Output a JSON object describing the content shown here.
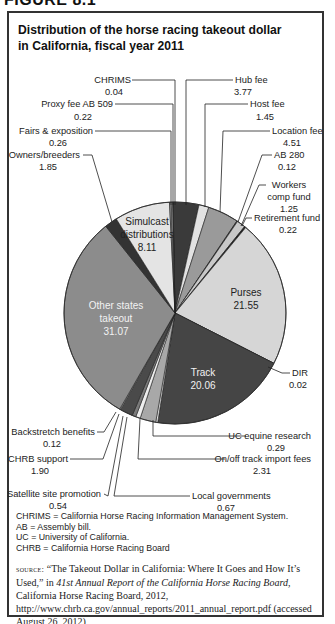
{
  "figure_header": "FIGURE 8.1",
  "title": "Distribution of the horse racing takeout dollar in California, fiscal year 2011",
  "chart_data": {
    "type": "pie",
    "title": "Distribution of the horse racing takeout dollar in California, fiscal year 2011",
    "units": "cents per takeout dollar",
    "start_angle_deg": -1,
    "direction": "clockwise",
    "slices": [
      {
        "label": "Hub fee",
        "value": 3.77,
        "color": "#3a3a3a"
      },
      {
        "label": "Host fee",
        "value": 1.45,
        "color": "#e2e2e2"
      },
      {
        "label": "Location fee",
        "value": 4.51,
        "color": "#9a9a9a"
      },
      {
        "label": "AB 280",
        "value": 0.12,
        "color": "#2a2a2a"
      },
      {
        "label": "Workers comp fund",
        "value": 1.25,
        "color": "#c8c8c8"
      },
      {
        "label": "Retirement fund",
        "value": 0.22,
        "color": "#222222"
      },
      {
        "label": "Purses",
        "value": 21.55,
        "color": "#d6d6d6"
      },
      {
        "label": "DIR",
        "value": 0.02,
        "color": "#555555"
      },
      {
        "label": "Track",
        "value": 20.06,
        "color": "#454545"
      },
      {
        "label": "UC equine research",
        "value": 0.29,
        "color": "#e8e8e8"
      },
      {
        "label": "On/off track import fees",
        "value": 2.31,
        "color": "#a8a8a8"
      },
      {
        "label": "Local governments",
        "value": 0.67,
        "color": "#eeeeee"
      },
      {
        "label": "Satellite site promotion",
        "value": 0.54,
        "color": "#7a7a7a"
      },
      {
        "label": "CHRB support",
        "value": 1.9,
        "color": "#4a4a4a"
      },
      {
        "label": "Backstretch benefits",
        "value": 0.12,
        "color": "#dddddd"
      },
      {
        "label": "Other states takeout",
        "value": 31.07,
        "color": "#8c8c8c"
      },
      {
        "label": "Owners/breeders",
        "value": 1.85,
        "color": "#333333"
      },
      {
        "label": "Simulcast distributions",
        "value": 8.11,
        "color": "#e4e4e4"
      },
      {
        "label": "Fairs & exposition",
        "value": 0.26,
        "color": "#888888"
      },
      {
        "label": "Proxy fee AB 509",
        "value": 0.22,
        "color": "#cccccc"
      },
      {
        "label": "CHRIMS",
        "value": 0.04,
        "color": "#555555"
      }
    ],
    "legend_position": "callouts"
  },
  "callouts": {
    "chrims": {
      "name": "CHRIMS",
      "value": "0.04"
    },
    "proxy": {
      "name": "Proxy fee AB 509",
      "value": "0.22"
    },
    "fairs": {
      "name": "Fairs & exposition",
      "value": "0.26"
    },
    "owners": {
      "name": "Owners/breeders",
      "value": "1.85"
    },
    "hub": {
      "name": "Hub fee",
      "value": "3.77"
    },
    "host": {
      "name": "Host fee",
      "value": "1.45"
    },
    "location": {
      "name": "Location fee",
      "value": "4.51"
    },
    "ab280": {
      "name": "AB 280",
      "value": "0.12"
    },
    "workers_1": "Workers",
    "workers_2": "comp fund",
    "workers_value": "1.25",
    "retirement": {
      "name": "Retirement fund",
      "value": "0.22"
    },
    "simulcast_1": "Simulcast",
    "simulcast_2": "distributions",
    "simulcast_value": "8.11",
    "purses": {
      "name": "Purses",
      "value": "21.55"
    },
    "other_1": "Other states",
    "other_2": "takeout",
    "other_value": "31.07",
    "track": {
      "name": "Track",
      "value": "20.06"
    },
    "dir": {
      "name": "DIR",
      "value": "0.02"
    },
    "uc": {
      "name": "UC equine research",
      "value": "0.29"
    },
    "backstretch": {
      "name": "Backstretch benefits",
      "value": "0.12"
    },
    "chrb": {
      "name": "CHRB support",
      "value": "1.90"
    },
    "onoff": {
      "name": "On/off track import fees",
      "value": "2.31"
    },
    "satellite": {
      "name": "Satellite site promotion",
      "value": "0.54"
    },
    "local": {
      "name": "Local governments",
      "value": "0.67"
    }
  },
  "notes": [
    "CHRIMS = California Horse Racing Information Management System.",
    "AB = Assembly bill.",
    "UC = University of California.",
    "CHRB = California Horse Racing Board"
  ],
  "source": {
    "label": "source:",
    "text_1": " “The Takeout Dollar in California: Where It Goes and How It’s Used,” in ",
    "italic": "41st Annual Report of the California Horse Racing Board",
    "text_2": ", California Horse Racing Board, 2012, http://www.chrb.ca.gov/annual_reports/2011_annual_report.pdf (accessed August 26, 2012)"
  }
}
